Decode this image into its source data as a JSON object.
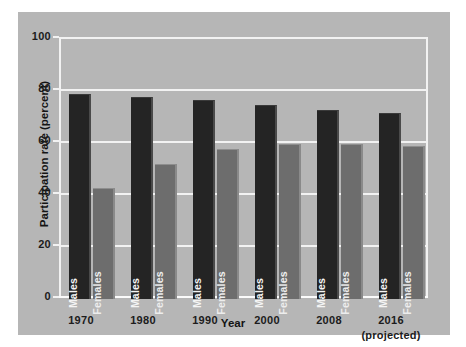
{
  "chart_data": {
    "type": "bar",
    "title": "",
    "xlabel": "Year",
    "ylabel": "Participation rate (percent)",
    "ylim": [
      0,
      100
    ],
    "yticks": [
      0,
      20,
      40,
      60,
      80,
      100
    ],
    "ytick_labels": [
      "0",
      "20",
      "40",
      "60",
      "80",
      "100"
    ],
    "grid": true,
    "legend": "in-bar labels",
    "categories": [
      "1970",
      "1980",
      "1990",
      "2000",
      "2008",
      "2016"
    ],
    "category_sublabels": [
      "",
      "",
      "",
      "",
      "",
      "(projected)"
    ],
    "series": [
      {
        "name": "Males",
        "color": "#242424",
        "values": [
          79,
          78,
          77,
          75,
          73,
          72
        ]
      },
      {
        "name": "Females",
        "color": "#6d6d6d",
        "values": [
          43,
          52,
          58,
          60,
          60,
          59
        ]
      }
    ],
    "bar_labels": [
      "Males",
      "Females"
    ]
  },
  "colors": {
    "panel_background": "#b6b6b6",
    "page_background": "#ffffff",
    "gridline": "#f2f2f2",
    "males_bar": "#242424",
    "females_bar": "#6d6d6d",
    "text": "#1c1c1c"
  }
}
